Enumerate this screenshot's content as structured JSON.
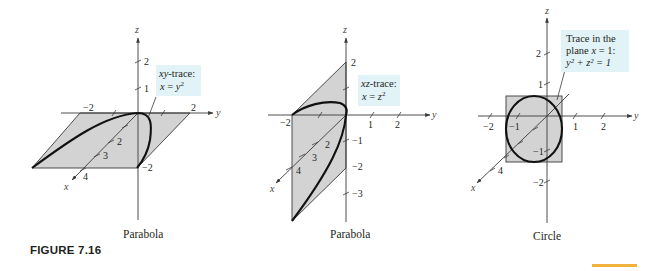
{
  "figure": {
    "label": "FIGURE 7.16",
    "accent_color": "#f2b33d",
    "plane_fill": "#d3d3d3",
    "callout_fill": "#e2f3f8"
  },
  "panels": [
    {
      "caption": "Parabola",
      "axes": {
        "x": "x",
        "y": "y",
        "z": "z"
      },
      "ticks": {
        "z": [
          "1",
          "2"
        ],
        "y": [
          "−2",
          "2"
        ],
        "x": [
          "2",
          "3",
          "4"
        ],
        "other": [
          "−2"
        ]
      },
      "callout": {
        "line1_italic": "xy",
        "line1_rest": "-trace:",
        "line2_lhs": "x",
        "line2_eq": " = ",
        "line2_rhs": "y",
        "line2_exp": "2"
      }
    },
    {
      "caption": "Parabola",
      "axes": {
        "x": "x",
        "y": "y",
        "z": "z"
      },
      "ticks": {
        "z": [
          "2",
          "−1",
          "−2",
          "−3"
        ],
        "y": [
          "−2",
          "1",
          "2"
        ],
        "x": [
          "2",
          "3",
          "4"
        ]
      },
      "callout": {
        "line1_italic": "xz",
        "line1_rest": "-trace:",
        "line2_lhs": "x",
        "line2_eq": " = ",
        "line2_rhs": "z",
        "line2_exp": "2"
      }
    },
    {
      "caption": "Circle",
      "axes": {
        "x": "x",
        "y": "y",
        "z": "z"
      },
      "ticks": {
        "z": [
          "2",
          "1",
          "−1",
          "−2"
        ],
        "y": [
          "−2",
          "−1",
          "1",
          "2"
        ],
        "x": [
          "4"
        ]
      },
      "callout": {
        "line1": "Trace in the",
        "line2_pre": "plane ",
        "line2_var": "x",
        "line2_post": " = 1:",
        "line3": "y² + z² = 1"
      }
    }
  ]
}
